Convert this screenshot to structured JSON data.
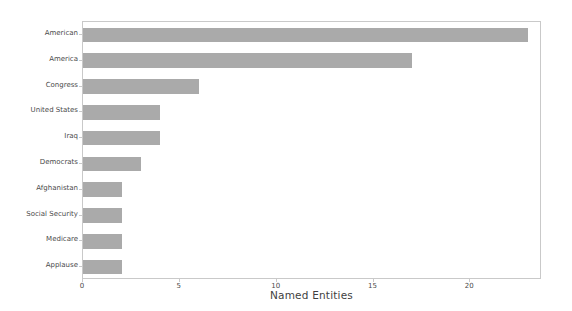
{
  "chart_data": {
    "type": "bar",
    "orientation": "horizontal",
    "title": "",
    "xlabel": "Named Entities",
    "ylabel": "Frequency",
    "categories": [
      "American",
      "America",
      "Congress",
      "United States",
      "Iraq",
      "Democrats",
      "Afghanistan",
      "Social Security",
      "Medicare",
      "Applause"
    ],
    "values": [
      23,
      17,
      6,
      4,
      4,
      3,
      2,
      2,
      2,
      2
    ],
    "xlim": [
      0,
      23.7
    ],
    "ylim": [
      0,
      10
    ],
    "xticks": [
      0,
      5,
      10,
      15,
      20
    ],
    "xtick_labels": [
      "0",
      "5",
      "10",
      "15",
      "20"
    ],
    "grid": false,
    "legend": null,
    "bar_color": "#aaaaaa",
    "axis_color": "#c9c9c9",
    "tick_label_color": "#4a4a4a",
    "axis_label_color": "#3f3f3f"
  }
}
